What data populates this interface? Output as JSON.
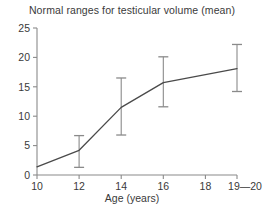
{
  "chart_data": {
    "type": "line",
    "title": "Normal ranges for testicular volume (mean)",
    "xlabel": "Age (years)",
    "ylabel": "",
    "x": [
      10,
      12,
      14,
      16,
      19.5
    ],
    "values": [
      1.4,
      4.2,
      11.5,
      15.7,
      18.1
    ],
    "error_low": [
      1.4,
      1.3,
      6.8,
      11.6,
      14.2
    ],
    "error_high": [
      1.4,
      6.7,
      16.5,
      20.1,
      22.2
    ],
    "xtick_values": [
      10,
      12,
      14,
      16,
      18,
      19.5
    ],
    "xtick_labels": [
      "10",
      "12",
      "14",
      "16",
      "18",
      "19—20"
    ],
    "ytick_values": [
      0,
      5,
      10,
      15,
      20,
      25
    ],
    "ytick_labels": [
      "0",
      "5",
      "10",
      "15",
      "20",
      "25"
    ],
    "xlim": [
      10,
      19.5
    ],
    "ylim": [
      0,
      25
    ],
    "grid": false,
    "legend": false,
    "line_color": "#4a4a4a",
    "errorbar_color": "#8a8a8a",
    "axis_color": "#8a8a8a",
    "text_color": "#3a3a3a",
    "background": "#ffffff"
  }
}
